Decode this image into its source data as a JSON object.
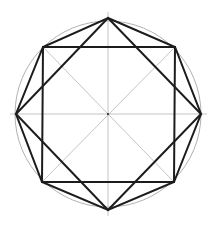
{
  "diagram": {
    "title": "",
    "colors": {
      "background": "#ffffff",
      "construction_lines": "#b5b5b5",
      "circle": "#a8a8a8",
      "shape_lines": "#1c1c1c"
    },
    "center": [
      108,
      114
    ],
    "radius": 93,
    "axis_points": {
      "top": [
        108,
        18
      ],
      "right": [
        201,
        114
      ],
      "bottom": [
        108,
        210
      ],
      "left": [
        16,
        114
      ]
    },
    "square_corners": {
      "top_left": [
        43,
        47
      ],
      "top_right": [
        175,
        47
      ],
      "bottom_right": [
        174,
        182
      ],
      "bottom_left": [
        42,
        182
      ]
    }
  }
}
